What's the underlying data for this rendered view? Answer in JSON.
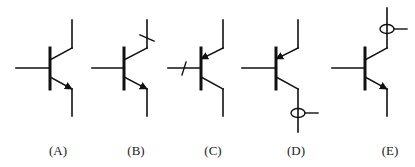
{
  "figure": {
    "stroke_color": "#111111",
    "symbols": [
      {
        "label": "(A)",
        "type": "NPN",
        "marking": "none"
      },
      {
        "label": "(B)",
        "type": "NPN",
        "marking": "slash on collector lead"
      },
      {
        "label": "(C)",
        "type": "PNP",
        "marking": "slash on base lead"
      },
      {
        "label": "(D)",
        "type": "PNP",
        "marking": "current probe loop on collector lead"
      },
      {
        "label": "(E)",
        "type": "NPN",
        "marking": "current probe loop on collector lead"
      }
    ]
  }
}
